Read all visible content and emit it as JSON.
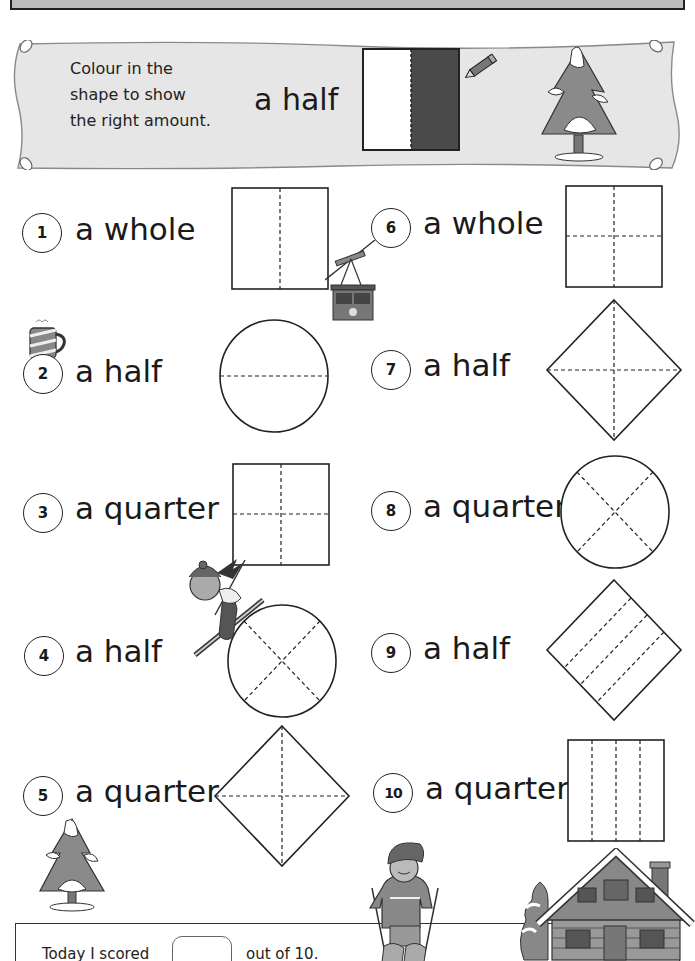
{
  "header": {
    "title_bar_visible": "partial"
  },
  "banner": {
    "instruction_lines": [
      "Colour in the",
      "shape to show",
      "the right amount."
    ],
    "example_label": "a half",
    "example_shape": "square split in half, right half shaded",
    "shade_color": "#4a4a4a"
  },
  "questions": [
    {
      "number": "1",
      "label": "a whole",
      "shape": "square",
      "divisions": "vertical halves"
    },
    {
      "number": "2",
      "label": "a half",
      "shape": "circle",
      "divisions": "horizontal halves"
    },
    {
      "number": "3",
      "label": "a quarter",
      "shape": "square",
      "divisions": "quarters (cross)"
    },
    {
      "number": "4",
      "label": "a half",
      "shape": "circle",
      "divisions": "quarters (diagonal X)"
    },
    {
      "number": "5",
      "label": "a quarter",
      "shape": "diamond",
      "divisions": "quarters (cross)"
    },
    {
      "number": "6",
      "label": "a whole",
      "shape": "square",
      "divisions": "quarters (cross)"
    },
    {
      "number": "7",
      "label": "a half",
      "shape": "diamond",
      "divisions": "quarters (cross)"
    },
    {
      "number": "8",
      "label": "a quarter",
      "shape": "circle",
      "divisions": "quarters (diagonal X)"
    },
    {
      "number": "9",
      "label": "a half",
      "shape": "diamond",
      "divisions": "four diagonal strips"
    },
    {
      "number": "10",
      "label": "a quarter",
      "shape": "rectangle",
      "divisions": "four vertical strips"
    }
  ],
  "score": {
    "prefix": "Today I scored",
    "value": "",
    "suffix": "out of 10."
  },
  "decorations": [
    "pin-icon",
    "pencil-icon",
    "snowy-tree-icon",
    "cable-car-icon",
    "hot-chocolate-mug-icon",
    "skier-girl-icon",
    "skier-boy-icon",
    "log-cabin-icon"
  ]
}
